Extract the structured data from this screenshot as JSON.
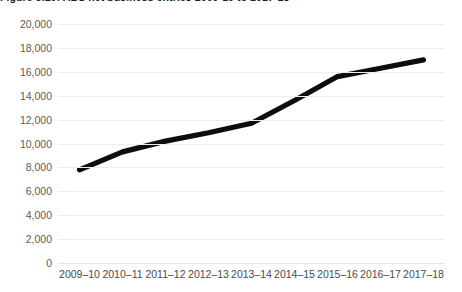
{
  "figure": {
    "title": "Figure 3.10: ABS net business entries 2009-10 to 2017-18"
  },
  "chart_data": {
    "type": "line",
    "title": "",
    "xlabel": "",
    "ylabel": "",
    "categories": [
      "2009–10",
      "2010–11",
      "2011–12",
      "2012–13",
      "2013–14",
      "2014–15",
      "2015–16",
      "2016–17",
      "2017–18"
    ],
    "values": [
      7800,
      9300,
      10200,
      10900,
      11700,
      13600,
      15600,
      16300,
      17000
    ],
    "ylim": [
      0,
      20000
    ],
    "yticks": [
      0,
      2000,
      4000,
      6000,
      8000,
      10000,
      12000,
      14000,
      16000,
      18000,
      20000
    ],
    "ytick_labels": [
      "0",
      "2,000",
      "4,000",
      "6,000",
      "8,000",
      "10,000",
      "12,000",
      "14,000",
      "16,000",
      "18,000",
      "20,000"
    ],
    "grid": true,
    "legend": false,
    "series_color": "#0d0d0d",
    "grid_color": "#eceded",
    "tick_label_color": "#5b5b5b"
  }
}
